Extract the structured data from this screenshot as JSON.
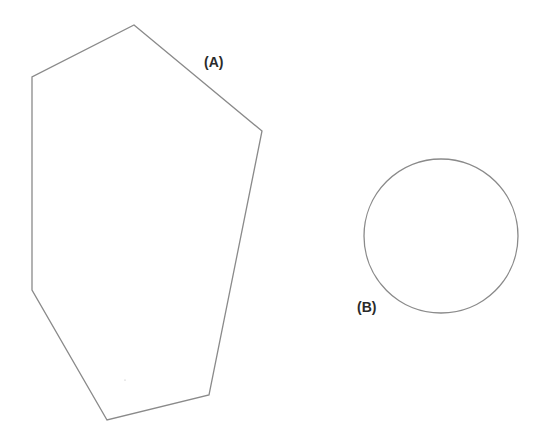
{
  "diagram": {
    "background": "#ffffff",
    "stroke_color": "#8a8a8a",
    "label_color": "#2a2a2a",
    "shapes": [
      {
        "id": "A",
        "type": "polygon",
        "label": "(A)",
        "vertices": [
          [
            134,
            25
          ],
          [
            262,
            131
          ],
          [
            209,
            395
          ],
          [
            107,
            420
          ],
          [
            32,
            290
          ],
          [
            32,
            77
          ]
        ],
        "label_pos": [
          204,
          67
        ]
      },
      {
        "id": "B",
        "type": "circle",
        "label": "(B)",
        "center": [
          441,
          236
        ],
        "radius": 77,
        "label_pos": [
          357,
          312
        ]
      }
    ]
  }
}
